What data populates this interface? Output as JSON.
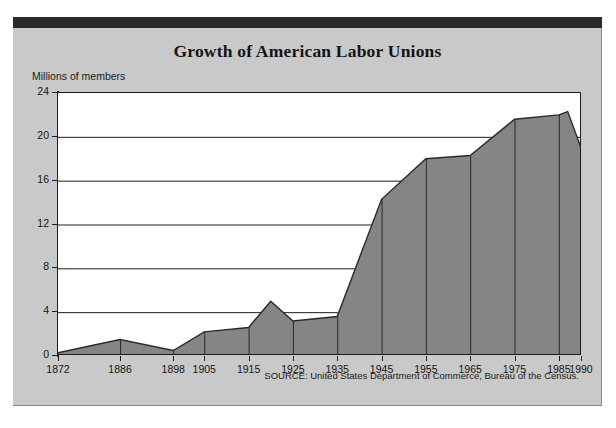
{
  "figure": {
    "title": "Growth of American Labor Unions",
    "source_note": "SOURCE: United States Department of Commerce, Bureau of the Census.",
    "panel_color": "#c9c9c9",
    "header_bar_color": "#2b2b2b",
    "plot_background": "#ffffff",
    "area_fill_color": "#858585",
    "area_outline_color": "#2a2a2a",
    "axis_color": "#1c1c1c"
  },
  "chart_data": {
    "type": "area",
    "title": "Growth of American Labor Unions",
    "xlabel": "",
    "ylabel": "Millions of members",
    "ylim": [
      0,
      24
    ],
    "xlim": [
      1872,
      1990
    ],
    "grid": true,
    "legend": "none",
    "ytick_labels": [
      "0",
      "4",
      "8",
      "12",
      "16",
      "20",
      "24"
    ],
    "ytick_values": [
      0,
      4,
      8,
      12,
      16,
      20,
      24
    ],
    "xtick_labels": [
      "1872",
      "1886",
      "1898",
      "1905",
      "1915",
      "1925",
      "1935",
      "1945",
      "1955",
      "1965",
      "1975",
      "1985",
      "1990"
    ],
    "xtick_values": [
      1872,
      1886,
      1898,
      1905,
      1915,
      1925,
      1935,
      1945,
      1955,
      1965,
      1975,
      1985,
      1990
    ],
    "x": [
      1872,
      1886,
      1898,
      1905,
      1915,
      1920,
      1925,
      1935,
      1945,
      1955,
      1965,
      1975,
      1985,
      1987,
      1990
    ],
    "values": [
      0.3,
      1.5,
      0.5,
      2.2,
      2.6,
      5.0,
      3.2,
      3.6,
      14.3,
      18.0,
      18.3,
      21.6,
      22.0,
      22.3,
      19.0
    ],
    "series": [
      {
        "name": "Union membership",
        "units": "millions of members",
        "points": [
          {
            "year": 1872,
            "value": 0.3
          },
          {
            "year": 1886,
            "value": 1.5
          },
          {
            "year": 1898,
            "value": 0.5
          },
          {
            "year": 1905,
            "value": 2.2
          },
          {
            "year": 1915,
            "value": 2.6
          },
          {
            "year": 1920,
            "value": 5.0
          },
          {
            "year": 1925,
            "value": 3.2
          },
          {
            "year": 1935,
            "value": 3.6
          },
          {
            "year": 1945,
            "value": 14.3
          },
          {
            "year": 1955,
            "value": 18.0
          },
          {
            "year": 1965,
            "value": 18.3
          },
          {
            "year": 1975,
            "value": 21.6
          },
          {
            "year": 1985,
            "value": 22.0
          },
          {
            "year": 1987,
            "value": 22.3
          },
          {
            "year": 1990,
            "value": 19.0
          }
        ]
      }
    ]
  }
}
